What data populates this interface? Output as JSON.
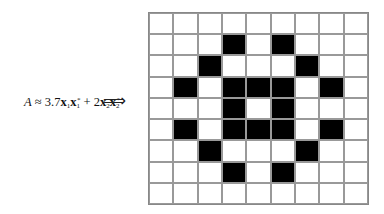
{
  "equation": {
    "lhs": "A",
    "approx": "≈",
    "coef1": "3.7",
    "vec1": "x",
    "vec1_sub": "1",
    "vec1b": "x",
    "vec1b_sub": "1",
    "vec1b_sup": "*",
    "plus": "+",
    "coef2": "2",
    "vec2": "x",
    "vec2_sub": "2",
    "vec2b": "x",
    "vec2b_sub": "2",
    "vec2b_sup": "*"
  },
  "arrow": "⟹",
  "grid": {
    "rows": 9,
    "cols": 9,
    "cells": [
      [
        0,
        0,
        0,
        0,
        0,
        0,
        0,
        0,
        0
      ],
      [
        0,
        0,
        0,
        1,
        0,
        1,
        0,
        0,
        0
      ],
      [
        0,
        0,
        1,
        0,
        0,
        0,
        1,
        0,
        0
      ],
      [
        0,
        1,
        0,
        1,
        1,
        1,
        0,
        1,
        0
      ],
      [
        0,
        0,
        0,
        1,
        0,
        1,
        0,
        0,
        0
      ],
      [
        0,
        1,
        0,
        1,
        1,
        1,
        0,
        1,
        0
      ],
      [
        0,
        0,
        1,
        0,
        0,
        0,
        1,
        0,
        0
      ],
      [
        0,
        0,
        0,
        1,
        0,
        1,
        0,
        0,
        0
      ],
      [
        0,
        0,
        0,
        0,
        0,
        0,
        0,
        0,
        0
      ]
    ],
    "on_color": "#000000",
    "off_color": "#ffffff"
  }
}
